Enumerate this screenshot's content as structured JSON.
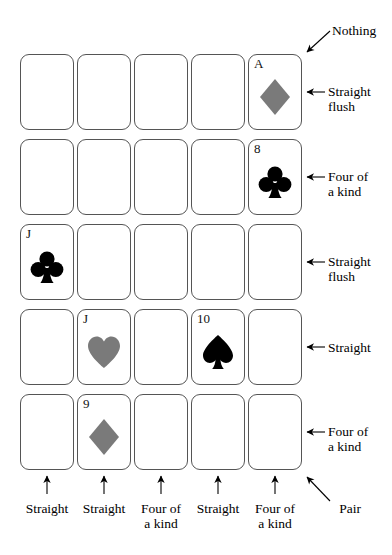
{
  "figure": {
    "title": "",
    "grid": {
      "rows": 5,
      "cols": 5,
      "card_x": [
        20,
        77,
        134,
        191,
        248
      ],
      "card_y": [
        54,
        139,
        224,
        309,
        394
      ],
      "card_w": 54,
      "card_h": 76
    },
    "colors": {
      "card_border": "#555555",
      "card_face": "#ffffff",
      "black_suit": "#000000",
      "red_suit_gray": "#7a7a7a",
      "text": "#000000",
      "arrow": "#000000"
    },
    "cards": [
      {
        "row": 0,
        "col": 0,
        "rank": "",
        "suit": "",
        "suit_name": ""
      },
      {
        "row": 0,
        "col": 1,
        "rank": "",
        "suit": "",
        "suit_name": ""
      },
      {
        "row": 0,
        "col": 2,
        "rank": "",
        "suit": "",
        "suit_name": ""
      },
      {
        "row": 0,
        "col": 3,
        "rank": "",
        "suit": "",
        "suit_name": ""
      },
      {
        "row": 0,
        "col": 4,
        "rank": "A",
        "suit": "diamond",
        "suit_name": "diamond-suit-icon"
      },
      {
        "row": 1,
        "col": 0,
        "rank": "",
        "suit": "",
        "suit_name": ""
      },
      {
        "row": 1,
        "col": 1,
        "rank": "",
        "suit": "",
        "suit_name": ""
      },
      {
        "row": 1,
        "col": 2,
        "rank": "",
        "suit": "",
        "suit_name": ""
      },
      {
        "row": 1,
        "col": 3,
        "rank": "",
        "suit": "",
        "suit_name": ""
      },
      {
        "row": 1,
        "col": 4,
        "rank": "8",
        "suit": "club",
        "suit_name": "club-suit-icon"
      },
      {
        "row": 2,
        "col": 0,
        "rank": "J",
        "suit": "club",
        "suit_name": "club-suit-icon"
      },
      {
        "row": 2,
        "col": 1,
        "rank": "",
        "suit": "",
        "suit_name": ""
      },
      {
        "row": 2,
        "col": 2,
        "rank": "",
        "suit": "",
        "suit_name": ""
      },
      {
        "row": 2,
        "col": 3,
        "rank": "",
        "suit": "",
        "suit_name": ""
      },
      {
        "row": 2,
        "col": 4,
        "rank": "",
        "suit": "",
        "suit_name": ""
      },
      {
        "row": 3,
        "col": 0,
        "rank": "",
        "suit": "",
        "suit_name": ""
      },
      {
        "row": 3,
        "col": 1,
        "rank": "J",
        "suit": "heart",
        "suit_name": "heart-suit-icon"
      },
      {
        "row": 3,
        "col": 2,
        "rank": "",
        "suit": "",
        "suit_name": ""
      },
      {
        "row": 3,
        "col": 3,
        "rank": "10",
        "suit": "spade",
        "suit_name": "spade-suit-icon"
      },
      {
        "row": 3,
        "col": 4,
        "rank": "",
        "suit": "",
        "suit_name": ""
      },
      {
        "row": 4,
        "col": 0,
        "rank": "",
        "suit": "",
        "suit_name": ""
      },
      {
        "row": 4,
        "col": 1,
        "rank": "9",
        "suit": "diamond",
        "suit_name": "diamond-suit-icon"
      },
      {
        "row": 4,
        "col": 2,
        "rank": "",
        "suit": "",
        "suit_name": ""
      },
      {
        "row": 4,
        "col": 3,
        "rank": "",
        "suit": "",
        "suit_name": ""
      },
      {
        "row": 4,
        "col": 4,
        "rank": "",
        "suit": "",
        "suit_name": ""
      }
    ],
    "row_labels": [
      {
        "id": "row-label-0",
        "text": "Straight\nflush",
        "row": 0
      },
      {
        "id": "row-label-1",
        "text": "Four of\na kind",
        "row": 1
      },
      {
        "id": "row-label-2",
        "text": "Straight\nflush",
        "row": 2
      },
      {
        "id": "row-label-3",
        "text": "Straight",
        "row": 3
      },
      {
        "id": "row-label-4",
        "text": "Four of\na kind",
        "row": 4
      }
    ],
    "column_labels": [
      {
        "id": "col-label-0",
        "text": "Straight",
        "col": 0
      },
      {
        "id": "col-label-1",
        "text": "Straight",
        "col": 1
      },
      {
        "id": "col-label-2",
        "text": "Four of\na kind",
        "col": 2
      },
      {
        "id": "col-label-3",
        "text": "Straight",
        "col": 3
      },
      {
        "id": "col-label-4",
        "text": "Four of\na kind",
        "col": 4
      }
    ],
    "diagonal_labels": [
      {
        "id": "diagonal-label-nothing",
        "text": "Nothing"
      },
      {
        "id": "diagonal-label-pair",
        "text": "Pair"
      }
    ]
  }
}
